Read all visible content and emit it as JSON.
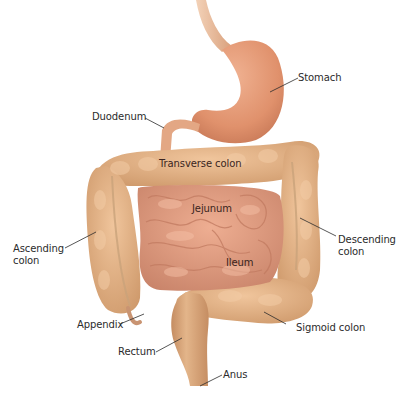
{
  "diagram": {
    "colors": {
      "background": "#ffffff",
      "stomach": "#e39a78",
      "esophagus": "#e2b08c",
      "small_intestine": "#df9a7e",
      "large_intestine": "#e0ad82",
      "rectum": "#d9a57a",
      "label_text": "#2b2b2b",
      "leader_line": "#2b2b2b"
    },
    "labels": {
      "stomach": "Stomach",
      "duodenum": "Duodenum",
      "transverse_colon": "Transverse colon",
      "jejunum": "Jejunum",
      "ascending_colon": "Ascending\ncolon",
      "descending_colon": "Descending\ncolon",
      "ileum": "Ileum",
      "appendix": "Appendix",
      "sigmoid_colon": "Sigmoid colon",
      "rectum": "Rectum",
      "anus": "Anus"
    }
  }
}
